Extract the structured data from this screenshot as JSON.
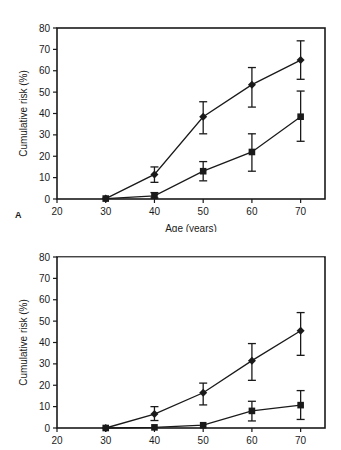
{
  "figure": {
    "panels": [
      {
        "letter": "A",
        "xlabel": "Age (years)",
        "ylabel": "Cumulative risk (%)"
      },
      {
        "letter": "",
        "xlabel": "",
        "ylabel": "Cumulative risk (%)"
      }
    ]
  },
  "chart_data": [
    {
      "type": "line",
      "panel": "A",
      "title": "",
      "xlabel": "Age (years)",
      "ylabel": "Cumulative risk (%)",
      "xlim": [
        20,
        75
      ],
      "ylim": [
        0,
        80
      ],
      "xticks": [
        20,
        30,
        40,
        50,
        60,
        70
      ],
      "yticks": [
        0,
        10,
        20,
        30,
        40,
        50,
        60,
        70,
        80
      ],
      "grid": false,
      "legend": "none",
      "x": [
        30,
        40,
        50,
        60,
        70
      ],
      "series": [
        {
          "name": "diamond-series",
          "marker": "diamond",
          "values": [
            0.2,
            11.5,
            38.5,
            53.5,
            65.0
          ],
          "err_low": [
            0.2,
            7.8,
            30.5,
            43.0,
            56.0
          ],
          "err_high": [
            0.2,
            15.0,
            45.5,
            61.5,
            74.0
          ]
        },
        {
          "name": "square-series",
          "marker": "square",
          "values": [
            0.2,
            1.5,
            13.0,
            22.0,
            38.5
          ],
          "err_low": [
            0.2,
            0.5,
            8.5,
            13.0,
            27.0
          ],
          "err_high": [
            0.2,
            3.0,
            17.5,
            30.5,
            50.5
          ]
        }
      ]
    },
    {
      "type": "line",
      "panel": "B",
      "title": "",
      "xlabel": "",
      "ylabel": "Cumulative risk (%)",
      "xlim": [
        20,
        75
      ],
      "ylim": [
        0,
        80
      ],
      "xticks": [
        20,
        30,
        40,
        50,
        60,
        70
      ],
      "yticks": [
        0,
        10,
        20,
        30,
        40,
        50,
        60,
        70,
        80
      ],
      "grid": false,
      "legend": "none",
      "x": [
        30,
        40,
        50,
        60,
        70
      ],
      "series": [
        {
          "name": "diamond-series",
          "marker": "diamond",
          "values": [
            0.0,
            6.5,
            16.5,
            31.5,
            45.5
          ],
          "err_low": [
            0.0,
            3.5,
            10.8,
            22.3,
            34.0
          ],
          "err_high": [
            0.0,
            10.0,
            21.0,
            39.5,
            54.0
          ]
        },
        {
          "name": "square-series",
          "marker": "square",
          "values": [
            0.0,
            0.3,
            1.3,
            8.0,
            10.7
          ],
          "err_low": [
            0.0,
            0.3,
            1.3,
            3.3,
            4.0
          ],
          "err_high": [
            0.0,
            0.3,
            1.3,
            12.5,
            17.5
          ]
        }
      ]
    }
  ],
  "axis_a": {
    "yticklabels": [
      "80",
      "70",
      "60",
      "50",
      "40",
      "30",
      "20",
      "10",
      "0"
    ],
    "xticklabels": [
      "20",
      "30",
      "40",
      "50",
      "60",
      "70"
    ]
  },
  "axis_b": {
    "yticklabels": [
      "80",
      "70",
      "60",
      "50",
      "40",
      "30",
      "20",
      "10",
      "0"
    ],
    "xticklabels": [
      "20",
      "30",
      "40",
      "50",
      "60",
      "70"
    ]
  }
}
